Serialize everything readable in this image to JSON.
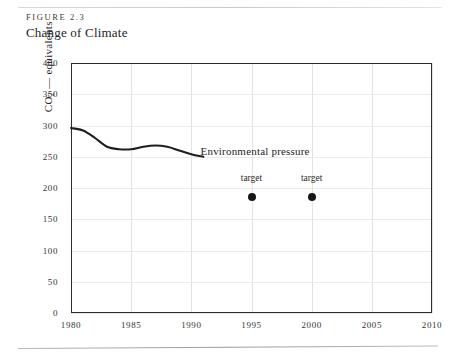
{
  "figure": {
    "label": "FIGURE 2.3",
    "title": "Change of Climate"
  },
  "chart_data": {
    "type": "line",
    "title": "Change of Climate",
    "xlabel": "",
    "ylabel": "CO2 — equivalents",
    "ylabel_plain": "CO",
    "ylabel_sub": "2",
    "ylabel_rest": " — equivalents",
    "xlim": [
      1980,
      2010
    ],
    "ylim": [
      0,
      400
    ],
    "grid": true,
    "legend": "none",
    "xticks": [
      "1980",
      "1985",
      "1990",
      "1995",
      "2000",
      "2005",
      "2010"
    ],
    "yticks": [
      "0",
      "50",
      "100",
      "150",
      "200",
      "250",
      "300",
      "350",
      "400"
    ],
    "series": [
      {
        "name": "Environmental pressure",
        "style": "line",
        "x": [
          1980,
          1981,
          1982,
          1983,
          1984,
          1985,
          1986,
          1987,
          1988,
          1989,
          1990,
          1991
        ],
        "values": [
          296,
          292,
          280,
          266,
          262,
          262,
          266,
          268,
          266,
          260,
          254,
          250
        ]
      },
      {
        "name": "target",
        "style": "point",
        "x": [
          1995,
          2000
        ],
        "values": [
          185,
          185
        ]
      }
    ],
    "annotations": [
      {
        "text": "Environmental pressure",
        "x": 1996.0,
        "y": 258
      },
      {
        "text": "target",
        "x": 1995,
        "y": 213
      },
      {
        "text": "target",
        "x": 2000,
        "y": 213
      }
    ]
  }
}
